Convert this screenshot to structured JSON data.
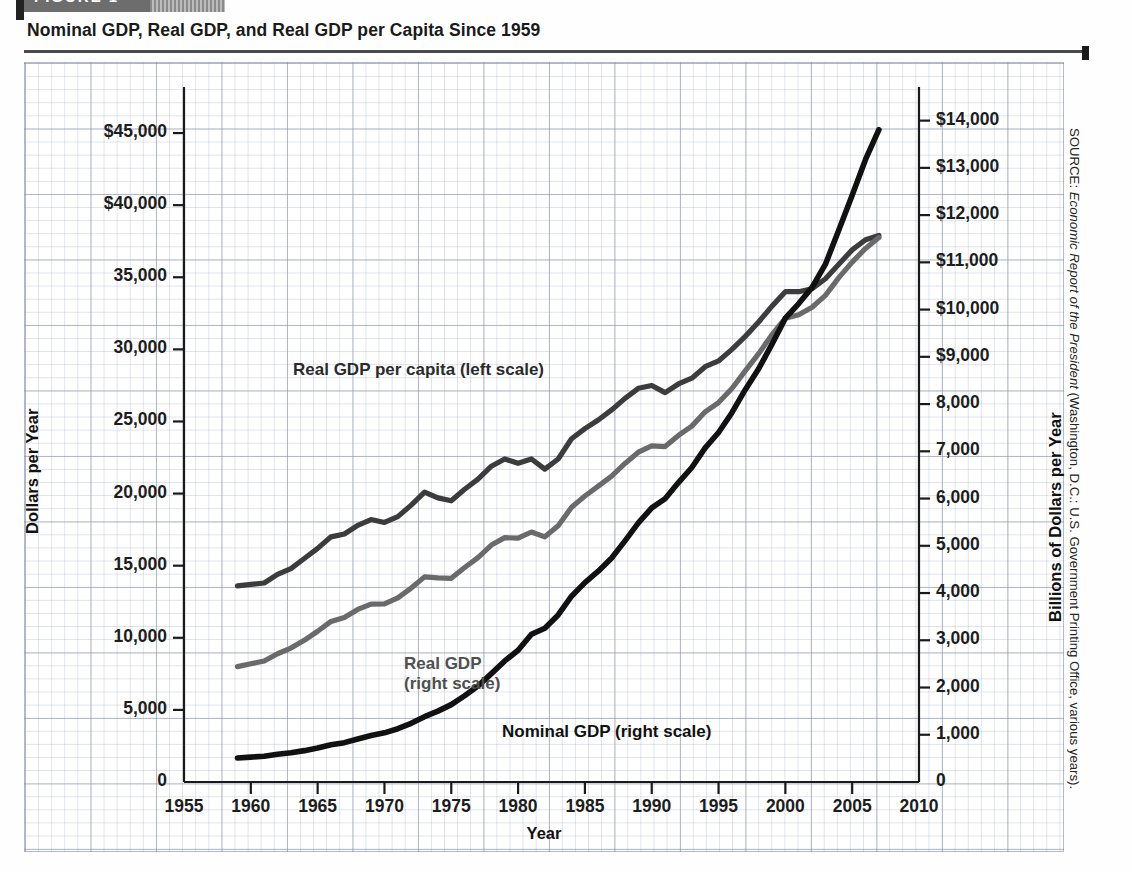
{
  "figure": {
    "tab_label": "FIGURE 1",
    "title": "Nominal GDP, Real GDP, and Real GDP per Capita Since 1959",
    "source_prefix": "SOURCE: ",
    "source_italic": "Economic Report of the President",
    "source_suffix": " (Washington, D.C.: U.S. Government Printing Office, various years)."
  },
  "chart_data": {
    "type": "line",
    "title": "Nominal GDP, Real GDP, and Real GDP per Capita Since 1959",
    "xlabel": "Year",
    "ylabel": "Dollars per Year",
    "ylabel_right": "Billions of Dollars per Year",
    "xlim": [
      1955,
      2010
    ],
    "ylim_left": [
      0,
      47500
    ],
    "ylim_right": [
      0,
      14500
    ],
    "grid": true,
    "legend_position": "inline-annotations",
    "xticks": [
      "1955",
      "1960",
      "1965",
      "1970",
      "1975",
      "1980",
      "1985",
      "1990",
      "1995",
      "2000",
      "2005",
      "2010"
    ],
    "yticks_left": [
      "0",
      "5,000",
      "10,000",
      "15,000",
      "20,000",
      "25,000",
      "30,000",
      "35,000",
      "$40,000",
      "$45,000"
    ],
    "yticks_left_values": [
      0,
      5000,
      10000,
      15000,
      20000,
      25000,
      30000,
      35000,
      40000,
      45000
    ],
    "yticks_right": [
      "0",
      "1,000",
      "2,000",
      "3,000",
      "4,000",
      "5,000",
      "6,000",
      "7,000",
      "8,000",
      "$9,000",
      "$10,000",
      "$11,000",
      "$12,000",
      "$13,000",
      "$14,000"
    ],
    "yticks_right_values": [
      0,
      1000,
      2000,
      3000,
      4000,
      5000,
      6000,
      7000,
      8000,
      9000,
      10000,
      11000,
      12000,
      13000,
      14000
    ],
    "x": [
      1959,
      1960,
      1961,
      1962,
      1963,
      1964,
      1965,
      1966,
      1967,
      1968,
      1969,
      1970,
      1971,
      1972,
      1973,
      1974,
      1975,
      1976,
      1977,
      1978,
      1979,
      1980,
      1981,
      1982,
      1983,
      1984,
      1985,
      1986,
      1987,
      1988,
      1989,
      1990,
      1991,
      1992,
      1993,
      1994,
      1995,
      1996,
      1997,
      1998,
      1999,
      2000,
      2001,
      2002,
      2003,
      2004,
      2005,
      2006,
      2007
    ],
    "series": [
      {
        "name": "Real GDP per capita (left scale)",
        "axis": "left",
        "units": "dollars per year",
        "color": "#3c3c3c",
        "annotation": "Real GDP per capita (left scale)",
        "values": [
          13600,
          13700,
          13800,
          14400,
          14800,
          15500,
          16200,
          17000,
          17200,
          17800,
          18200,
          18000,
          18400,
          19200,
          20100,
          19700,
          19500,
          20300,
          21000,
          21900,
          22400,
          22100,
          22400,
          21700,
          22400,
          23800,
          24500,
          25100,
          25800,
          26600,
          27300,
          27500,
          27000,
          27600,
          28000,
          28800,
          29200,
          30000,
          30900,
          31900,
          33000,
          34000,
          34000,
          34200,
          34900,
          35900,
          36900,
          37600,
          37900
        ]
      },
      {
        "name": "Real GDP (right scale)",
        "axis": "right",
        "units": "billions of dollars per year",
        "color": "#6a6a6a",
        "annotation": "Real GDP\n(right scale)",
        "values": [
          2442,
          2502,
          2560,
          2715,
          2834,
          2999,
          3191,
          3399,
          3484,
          3653,
          3765,
          3772,
          3899,
          4105,
          4342,
          4320,
          4312,
          4540,
          4751,
          5015,
          5173,
          5162,
          5292,
          5189,
          5424,
          5814,
          6054,
          6264,
          6475,
          6743,
          6981,
          7113,
          7101,
          7337,
          7533,
          7836,
          8032,
          8329,
          8704,
          9067,
          9470,
          9817,
          9891,
          10049,
          10301,
          10676,
          11004,
          11295,
          11524
        ]
      },
      {
        "name": "Nominal GDP (right scale)",
        "axis": "right",
        "units": "billions of dollars per year",
        "color": "#111111",
        "annotation": "Nominal GDP (right scale)",
        "values": [
          507,
          527,
          545,
          586,
          618,
          664,
          719,
          788,
          833,
          910,
          985,
          1040,
          1128,
          1241,
          1383,
          1500,
          1638,
          1825,
          2031,
          2295,
          2563,
          2790,
          3128,
          3255,
          3537,
          3933,
          4220,
          4463,
          4740,
          5104,
          5484,
          5803,
          5996,
          6338,
          6657,
          7072,
          7398,
          7817,
          8304,
          8747,
          9268,
          9817,
          10128,
          10470,
          10961,
          11686,
          12422,
          13178,
          13808
        ]
      }
    ]
  }
}
